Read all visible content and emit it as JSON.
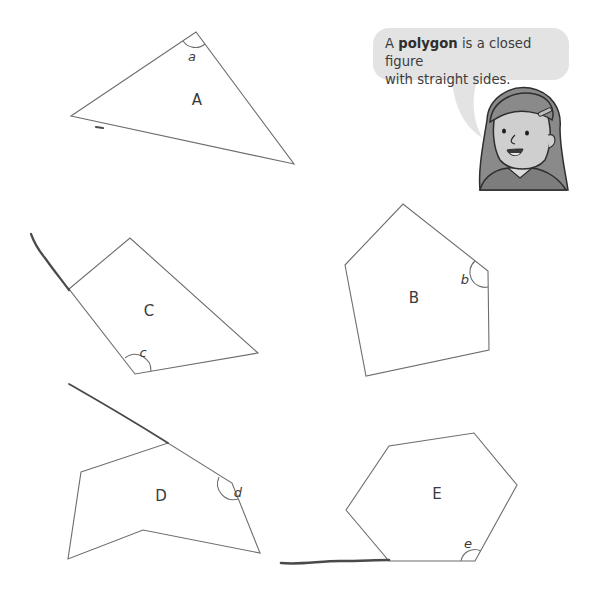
{
  "speech_bubble": {
    "prefix": "A ",
    "term": "polygon",
    "suffix": " is a closed figure",
    "line2": "with straight sides.",
    "fill_color": "#e3e3e3"
  },
  "character": {
    "description": "girl-with-hair-clip",
    "icon": "girl-icon"
  },
  "shapes": [
    {
      "id": "A",
      "label": "A",
      "type": "triangle",
      "angle_label": "a",
      "points": "71,116 196,32 294,164"
    },
    {
      "id": "B",
      "label": "B",
      "type": "pentagon",
      "angle_label": "b",
      "points": "345,265 403,204 488,271 489,350 366,376"
    },
    {
      "id": "C",
      "label": "C",
      "type": "quadrilateral",
      "angle_label": "c",
      "points": "69,289 130,238 258,353 135,374"
    },
    {
      "id": "D",
      "label": "D",
      "type": "hexagon",
      "angle_label": "d",
      "points": "81,472 168,443 232,483 260,553 143,530 68,559"
    },
    {
      "id": "E",
      "label": "E",
      "type": "hexagon",
      "angle_label": "e",
      "points": "346,510 389,446 474,433 517,485 475,561 389,561"
    }
  ],
  "colors": {
    "line": "#6d6d6d",
    "pencil_mark": "#4a4a4a",
    "text": "#3a3a3a"
  }
}
